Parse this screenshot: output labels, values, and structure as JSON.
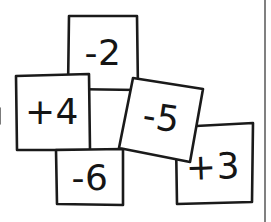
{
  "scene": {
    "title": "Handwritten integer cards",
    "background_color": "#ffffff",
    "ink_color": "#1a1a1a",
    "width": 271,
    "height": 222
  },
  "cards": [
    {
      "id": "card-minus-2",
      "label": "-2",
      "value": -2,
      "sign": "negative",
      "position": "top-center",
      "rotation_deg": 0,
      "polygon": "69,16 137,16 138,90 68,89",
      "label_x": 103,
      "label_y": 55,
      "label_rotation_deg": 0
    },
    {
      "id": "card-plus-4",
      "label": "+4",
      "value": 4,
      "sign": "positive",
      "position": "left",
      "rotation_deg": 0,
      "polygon": "16,76 89,74 90,150 17,150",
      "label_x": 52,
      "label_y": 114,
      "label_rotation_deg": 0
    },
    {
      "id": "card-minus-6",
      "label": "-6",
      "value": -6,
      "sign": "negative",
      "position": "bottom-center",
      "rotation_deg": 0,
      "polygon": "56,150 123,149 123,205 57,204",
      "label_x": 90,
      "label_y": 180,
      "label_rotation_deg": 0
    },
    {
      "id": "card-minus-5",
      "label": "-5",
      "value": -5,
      "sign": "negative",
      "position": "center-right",
      "rotation_deg": -10,
      "polygon": "133,78 203,89 190,162 119,148",
      "label_x": 161,
      "label_y": 120,
      "label_rotation_deg": 9
    },
    {
      "id": "card-plus-3",
      "label": "+3",
      "value": 3,
      "sign": "positive",
      "position": "bottom-right",
      "rotation_deg": 2,
      "polygon": "196,126 253,123 252,202 177,204 176,141",
      "label_x": 213,
      "label_y": 169,
      "label_rotation_deg": -2
    }
  ],
  "artifacts": {
    "right_page_rule": {
      "x": 265,
      "y1": 0,
      "y2": 222
    },
    "left_edge_tick": {
      "x": 0,
      "y1": 108,
      "y2": 124
    }
  }
}
